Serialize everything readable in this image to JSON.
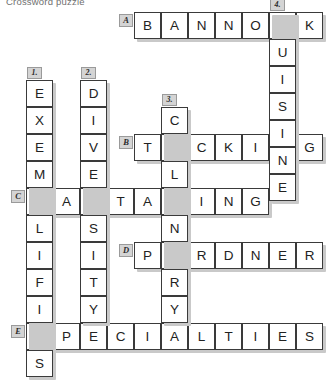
{
  "title": "Crossword puzzle",
  "grid": {
    "cell_size": 27,
    "origin": {
      "x": 26,
      "y": 12
    },
    "colors": {
      "cell_fill": "#ffffff",
      "cell_border": "#3a3a3a",
      "shadow": "#c9c9c9",
      "badge_fill": "#d4d4d4",
      "badge_border": "#9a9a9a",
      "letter": "#222222",
      "title": "#6f6f6f"
    }
  },
  "entries": [
    {
      "label": "A",
      "direction": "across",
      "answer": "BANNOCK",
      "letters": [
        "B",
        "A",
        "N",
        "N",
        "O",
        "C",
        "K"
      ],
      "col": 4,
      "row": 0
    },
    {
      "label": "B",
      "direction": "across",
      "answer": "TUCKING",
      "letters": [
        "T",
        "U",
        "C",
        "K",
        "I",
        "N",
        "G"
      ],
      "col": 4,
      "row": 4.5
    },
    {
      "label": "C",
      "direction": "across",
      "answer": "PARTAKING",
      "letters": [
        "P",
        "A",
        "R",
        "T",
        "A",
        "K",
        "I",
        "N",
        "G"
      ],
      "col": 0,
      "row": 6.5
    },
    {
      "label": "D",
      "direction": "across",
      "answer": "PARDNER",
      "letters": [
        "P",
        "A",
        "R",
        "D",
        "N",
        "E",
        "R"
      ],
      "col": 4,
      "row": 8.5
    },
    {
      "label": "E",
      "direction": "across",
      "answer": "SPECIALTIES",
      "letters": [
        "S",
        "P",
        "E",
        "C",
        "I",
        "A",
        "L",
        "T",
        "I",
        "E",
        "S"
      ],
      "col": 0,
      "row": 11.5
    },
    {
      "label": "1.",
      "direction": "down",
      "answer": "EXEMPLIFIES",
      "letters": [
        "E",
        "X",
        "E",
        "M",
        "P",
        "L",
        "I",
        "F",
        "I",
        "E",
        "S"
      ],
      "col": 0,
      "row": 2.5
    },
    {
      "label": "2.",
      "direction": "down",
      "answer": "DIVERSITY",
      "letters": [
        "D",
        "I",
        "V",
        "E",
        "R",
        "S",
        "I",
        "T",
        "Y"
      ],
      "col": 2,
      "row": 2.5
    },
    {
      "label": "3.",
      "direction": "down",
      "answer": "CULINARY",
      "letters": [
        "C",
        "U",
        "L",
        "I",
        "N",
        "A",
        "R",
        "Y"
      ],
      "col": 5,
      "row": 3.5
    },
    {
      "label": "4.",
      "direction": "down",
      "answer": "CUISINE",
      "letters": [
        "C",
        "U",
        "I",
        "S",
        "I",
        "N",
        "E"
      ],
      "col": 9,
      "row": 0
    }
  ]
}
